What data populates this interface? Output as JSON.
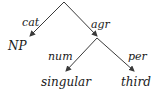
{
  "diagram": {
    "type": "feature-structure-dag",
    "colors": {
      "line": "#3a3a3a",
      "text": "#1a1a1a",
      "background": "#ffffff"
    },
    "root": {
      "x": 64,
      "y": 2
    },
    "edges": [
      {
        "label": "cat",
        "from": "root",
        "to": "NP"
      },
      {
        "label": "agr",
        "from": "root",
        "to": "agr-node"
      },
      {
        "label": "num",
        "from": "agr-node",
        "to": "singular"
      },
      {
        "label": "per",
        "from": "agr-node",
        "to": "third"
      }
    ],
    "labels": {
      "cat": "cat",
      "agr": "agr",
      "num": "num",
      "per": "per",
      "np": "NP",
      "singular": "singular",
      "third": "third"
    }
  }
}
